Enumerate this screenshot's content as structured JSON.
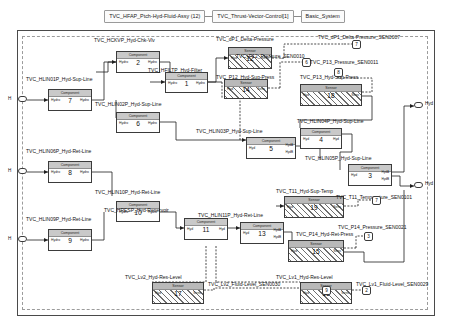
{
  "breadcrumb": {
    "items": [
      {
        "label": "TVC_HFAP_Ptch-Hyd-Fluid-Assy (12)"
      },
      {
        "label": "TVC_Thrust-Vector-Control[1]"
      },
      {
        "label": "Basic_System"
      }
    ]
  },
  "diagram": {
    "component_caption": "Component",
    "sensor_caption": "Sensor",
    "port_hyd": "Hyd",
    "port_hydro": "Hydro",
    "port_sens": "Sens",
    "port_hyda": "HydA",
    "port_hydb": "HydB",
    "blocks": [
      {
        "id": "b1",
        "name": "TVC_HCKVP_Hyd-Chk-Vlv",
        "num": "2",
        "kind": "component"
      },
      {
        "id": "b2",
        "name": "TVC_HLIN01P_Hyd-Sup-Line",
        "num": "7",
        "kind": "component"
      },
      {
        "id": "b3",
        "name": "TVC_HFILTP_Hyd-Filter",
        "num": "1",
        "kind": "component"
      },
      {
        "id": "b4",
        "name": "TVC_HLIN02P_Hyd-Sup-Line",
        "num": "6",
        "kind": "component"
      },
      {
        "id": "b5",
        "name": "TVC_HLIN06P_Hyd-Ret-Line",
        "num": "8",
        "kind": "component"
      },
      {
        "id": "b6",
        "name": "TVC_HLIN09P_Hyd-Ret-Line",
        "num": "9",
        "kind": "component"
      },
      {
        "id": "b7",
        "name": "TVC_HLIN10P_Hyd-Ret-Line",
        "num": "10",
        "kind": "component"
      },
      {
        "id": "b8",
        "name": "TVC_HRESP_Hyd-Reservoir",
        "num": "11",
        "kind": "component"
      },
      {
        "id": "b9",
        "name": "TVC_HLIN11P_Hyd-Ret-Line",
        "num": "13",
        "kind": "component"
      },
      {
        "id": "b10",
        "name": "TVC_HLIN03P_Hyd-Sup-Line",
        "num": "5",
        "kind": "component"
      },
      {
        "id": "b11",
        "name": "TVC_HLIN04P_Hyd-Sup-Line",
        "num": "4",
        "kind": "component"
      },
      {
        "id": "b12",
        "name": "TVC_HLIN05P_Hyd-Sup-Line",
        "num": "3",
        "kind": "component"
      },
      {
        "id": "b13",
        "name": "TVC_dP1_Delta-Pressure",
        "num": "12",
        "kind": "sensor"
      },
      {
        "id": "b14",
        "name": "TVC_P12_Hyd-Sup-Press",
        "num": "14",
        "kind": "sensor"
      },
      {
        "id": "b15",
        "name": "TVC_P13_Hyd-Sup-Press",
        "num": "18",
        "kind": "sensor"
      },
      {
        "id": "b16",
        "name": "TVC_T11_Hyd-Sup-Temp",
        "num": "19",
        "kind": "sensor"
      },
      {
        "id": "b17",
        "name": "TVC_P14_Hyd-Ret-Press",
        "num": "15",
        "kind": "sensor"
      },
      {
        "id": "b18",
        "name": "TVC_Lv2_Hyd-Res-Level",
        "num": "17",
        "kind": "sensor"
      },
      {
        "id": "b19",
        "name": "TVC_Lv1_Hyd-Res-Level",
        "num": "16",
        "kind": "sensor"
      }
    ],
    "signal_outputs": [
      {
        "id": "s1",
        "name": "TVC_dP1_Delta-Pressure_SEN0007",
        "num": "7"
      },
      {
        "id": "s2",
        "name": "TVC_P12_Pressure_SEN0010",
        "num": "6"
      },
      {
        "id": "s3",
        "name": "TVC_P13_Pressure_SEN0011",
        "num": "8"
      },
      {
        "id": "s4",
        "name": "TVC_T11_Temperature_SEN0101",
        "num": "7"
      },
      {
        "id": "s5",
        "name": "TVC_P14_Pressure_SEN0021",
        "num": "3"
      },
      {
        "id": "s6",
        "name": "TVC_Lv2_Fluid-Level_SEN0030",
        "num": "9"
      },
      {
        "id": "s7",
        "name": "TVC_Lv1_Fluid-Level_SEN0029",
        "num": "2"
      }
    ],
    "input_ports": [
      {
        "id": "i1",
        "label": "H"
      },
      {
        "id": "i2",
        "label": "H"
      },
      {
        "id": "i3",
        "label": "H"
      }
    ],
    "output_ports": [
      {
        "id": "o1",
        "label": "Hyd"
      },
      {
        "id": "o2",
        "label": "Hyd"
      }
    ]
  }
}
